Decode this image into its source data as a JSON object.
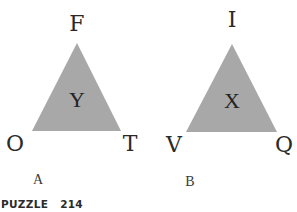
{
  "puzzle": {
    "title_word": "PUZZLE",
    "number": "214"
  },
  "colors": {
    "triangle_fill": "#a8a8a8",
    "text": "#2a2a2a"
  },
  "figures": [
    {
      "id": "A",
      "caption": "A",
      "center_letter": "Y",
      "vertices": {
        "top": "F",
        "bottom_left": "O",
        "bottom_right": "T"
      }
    },
    {
      "id": "B",
      "caption": "B",
      "center_letter": "X",
      "vertices": {
        "top": "I",
        "bottom_left": "V",
        "bottom_right": "Q"
      }
    }
  ]
}
